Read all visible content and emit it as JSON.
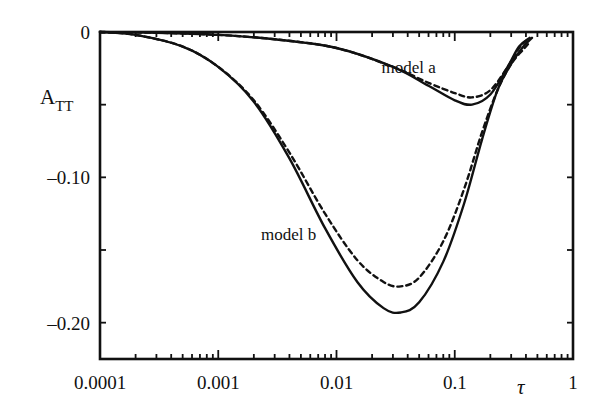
{
  "chart_data": {
    "type": "line",
    "title": "",
    "xlabel": "τ",
    "ylabel": "A",
    "ylabel_subscript": "TT",
    "xscale": "log",
    "xlim": [
      0.0001,
      1
    ],
    "ylim": [
      -0.225,
      0
    ],
    "x_ticks": [
      0.0001,
      0.001,
      0.01,
      0.1,
      1
    ],
    "x_tick_labels": [
      "0.0001",
      "0.001",
      "0.01",
      "0.1",
      "1"
    ],
    "y_ticks": [
      0,
      -0.05,
      -0.1,
      -0.15,
      -0.2
    ],
    "y_tick_labels": [
      "0",
      "",
      "–0.10",
      "",
      "–0.20"
    ],
    "grid": false,
    "legend": null,
    "annotations": [
      {
        "text": "model a",
        "x": 0.024,
        "y": -0.028
      },
      {
        "text": "model b",
        "x": 0.0023,
        "y": -0.143
      }
    ],
    "series": [
      {
        "name": "model a (solid)",
        "style": "solid",
        "x": [
          0.0001,
          0.0003,
          0.001,
          0.003,
          0.01,
          0.03,
          0.06,
          0.1,
          0.14,
          0.2,
          0.28,
          0.35,
          0.43
        ],
        "y": [
          0,
          -0.0005,
          -0.002,
          -0.005,
          -0.011,
          -0.024,
          -0.037,
          -0.047,
          -0.05,
          -0.043,
          -0.024,
          -0.01,
          -0.004
        ]
      },
      {
        "name": "model a (dashed)",
        "style": "dashed",
        "x": [
          0.0001,
          0.0003,
          0.001,
          0.003,
          0.01,
          0.03,
          0.06,
          0.1,
          0.14,
          0.2,
          0.28,
          0.35,
          0.4
        ],
        "y": [
          0,
          -0.0005,
          -0.002,
          -0.005,
          -0.011,
          -0.024,
          -0.035,
          -0.042,
          -0.045,
          -0.04,
          -0.024,
          -0.011,
          -0.006
        ]
      },
      {
        "name": "model b (solid)",
        "style": "solid",
        "x": [
          0.0001,
          0.0002,
          0.0005,
          0.001,
          0.002,
          0.004,
          0.008,
          0.015,
          0.025,
          0.035,
          0.05,
          0.08,
          0.12,
          0.17,
          0.23,
          0.3,
          0.38,
          0.45
        ],
        "y": [
          0,
          -0.002,
          -0.01,
          -0.024,
          -0.048,
          -0.087,
          -0.135,
          -0.172,
          -0.19,
          -0.193,
          -0.186,
          -0.158,
          -0.118,
          -0.074,
          -0.04,
          -0.022,
          -0.01,
          -0.004
        ]
      },
      {
        "name": "model b (dashed)",
        "style": "dashed",
        "x": [
          0.0001,
          0.0002,
          0.0005,
          0.001,
          0.002,
          0.004,
          0.008,
          0.015,
          0.025,
          0.035,
          0.05,
          0.08,
          0.12,
          0.17,
          0.23,
          0.3,
          0.38,
          0.43
        ],
        "y": [
          0,
          -0.002,
          -0.01,
          -0.024,
          -0.047,
          -0.083,
          -0.125,
          -0.157,
          -0.172,
          -0.175,
          -0.169,
          -0.144,
          -0.108,
          -0.069,
          -0.04,
          -0.022,
          -0.012,
          -0.007
        ]
      }
    ]
  },
  "axes": {
    "x_label": "τ",
    "y_label_main": "A",
    "y_label_sub": "TT"
  }
}
